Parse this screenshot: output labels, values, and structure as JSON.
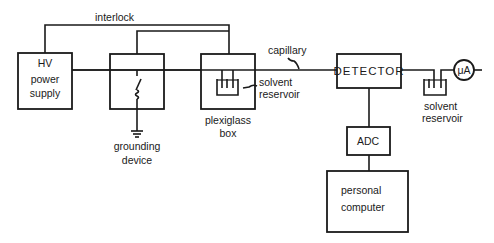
{
  "diagram": {
    "labels": {
      "interlock": "interlock",
      "capillary": "capillary",
      "hv_line1": "HV",
      "hv_line2": "power",
      "hv_line3": "supply",
      "grounding_line1": "grounding",
      "grounding_line2": "device",
      "plexiglass_line1": "plexiglass",
      "plexiglass_line2": "box",
      "solvent_in_line1": "solvent",
      "solvent_in_line2": "reservoir",
      "detector": "DETECTOR",
      "solvent_out_line1": "solvent",
      "solvent_out_line2": "reservoir",
      "ammeter": "μA",
      "adc": "ADC",
      "pc_line1": "personal",
      "pc_line2": "computer"
    },
    "components": [
      {
        "id": "hv-power-supply",
        "label": "HV power supply"
      },
      {
        "id": "grounding-device",
        "label": "grounding device"
      },
      {
        "id": "plexiglass-box",
        "label": "plexiglass box"
      },
      {
        "id": "detector",
        "label": "DETECTOR"
      },
      {
        "id": "solvent-reservoir-out",
        "label": "solvent reservoir"
      },
      {
        "id": "ammeter",
        "label": "μA"
      },
      {
        "id": "adc",
        "label": "ADC"
      },
      {
        "id": "personal-computer",
        "label": "personal computer"
      }
    ],
    "connections": [
      {
        "from": "hv-power-supply",
        "to": "plexiglass-box",
        "label": "interlock"
      },
      {
        "from": "grounding-device",
        "to": "plexiglass-box",
        "label": "interlock"
      },
      {
        "from": "hv-power-supply",
        "to": "detector",
        "label": "capillary"
      },
      {
        "from": "detector",
        "to": "ammeter"
      },
      {
        "from": "detector",
        "to": "adc"
      },
      {
        "from": "adc",
        "to": "personal-computer"
      }
    ]
  }
}
